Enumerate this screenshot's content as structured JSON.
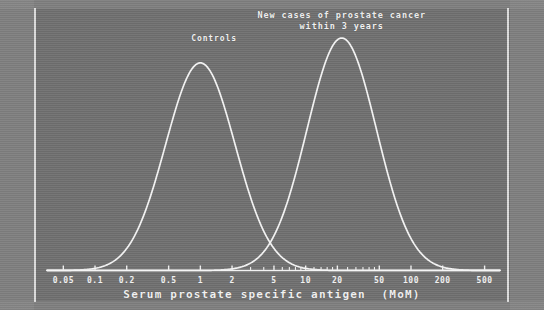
{
  "chart_data": {
    "type": "line",
    "title_line1": "New cases of prostate cancer",
    "title_line2": "within 3 years",
    "xlabel": "Serum prostate specific antigen  (MoM)",
    "ylabel": "",
    "xscale": "log",
    "xlim": [
      0.035,
      700
    ],
    "ylim": [
      0,
      1.05
    ],
    "grid": false,
    "legend_position": "inline-annotation",
    "axis_color": "#f2f2f2",
    "curve_color": "#f5f5f5",
    "background_color": "#6f6f6f",
    "tick_labels": [
      "0.05",
      "0.1",
      "0.2",
      "0.5",
      "1",
      "2",
      "5",
      "10",
      "20",
      "50",
      "100",
      "200",
      "500"
    ],
    "tick_values": [
      0.05,
      0.1,
      0.2,
      0.5,
      1,
      2,
      5,
      10,
      20,
      50,
      100,
      200,
      500
    ],
    "minor_tick_values": [
      3,
      4,
      6,
      7,
      8,
      9,
      12,
      14,
      16,
      18,
      25,
      30,
      35,
      40,
      45
    ],
    "series": [
      {
        "name": "Controls",
        "label": "Controls",
        "distribution": "lognormal",
        "median": 1.0,
        "log10_sd": 0.33,
        "peak_x": 1.0,
        "peak_y": 1.0,
        "label_x": 1.35,
        "label_y": 1.12
      },
      {
        "name": "New cases of prostate cancer within 3 years",
        "label": "New cases of prostate cancer\nwithin 3 years",
        "distribution": "lognormal",
        "median": 22.0,
        "log10_sd": 0.33,
        "peak_x": 22.0,
        "peak_y": 1.12,
        "label_x": 22.0,
        "label_y": 1.35
      }
    ],
    "annotations": [
      {
        "text": "Controls",
        "x": 1.35,
        "y": 1.12
      },
      {
        "text": "New cases of prostate cancer",
        "x": 22.0,
        "y": 1.4
      },
      {
        "text": "within 3 years",
        "x": 22.0,
        "y": 1.32
      }
    ]
  }
}
